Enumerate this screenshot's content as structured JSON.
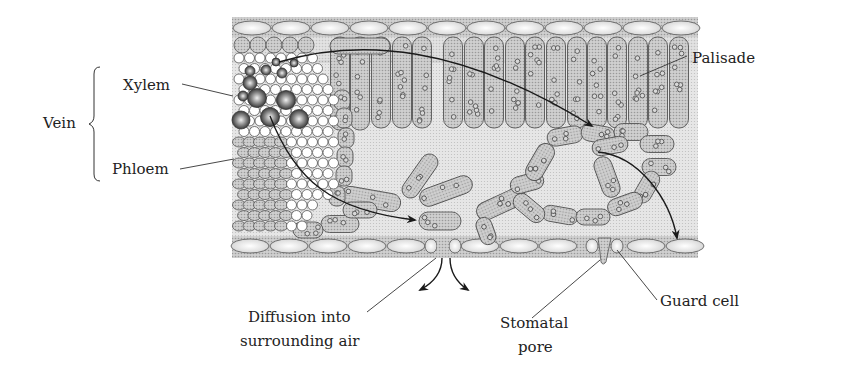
{
  "diagram": {
    "labels": {
      "vein": "Vein",
      "xylem": "Xylem",
      "phloem": "Phloem",
      "palisade": "Palisade",
      "diffusion_line1": "Diffusion into",
      "diffusion_line2": "surrounding air",
      "stomatal_line1": "Stomatal",
      "stomatal_line2": "pore",
      "guard_cell": "Guard cell"
    },
    "colors": {
      "tissue_fill": "#c8c8c8",
      "cell_fill": "#b4b4b4",
      "cell_stroke": "#555555",
      "epidermis_cell": "#eeeeee",
      "airspace": "#e4e4e4",
      "arrow": "#1a1a1a",
      "text": "#222222"
    }
  }
}
